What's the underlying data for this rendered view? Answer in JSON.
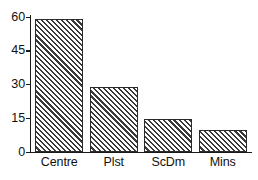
{
  "chart_data": {
    "type": "bar",
    "title": "",
    "subtitle": "",
    "xlabel": "",
    "ylabel": "",
    "categories": [
      "Centre",
      "Plst",
      "ScDm",
      "Mins"
    ],
    "values": [
      59,
      29,
      14.5,
      10
    ],
    "series": [
      {
        "name": "",
        "values": [
          59,
          29,
          14.5,
          10
        ]
      }
    ],
    "ylim": [
      0,
      60
    ],
    "yticks": [
      0,
      15,
      30,
      45,
      60
    ],
    "ytick_labels": [
      "0",
      "15",
      "30",
      "45",
      "60"
    ],
    "grid": false,
    "legend": false,
    "legend_position": "none",
    "annotations": [],
    "bar_style": {
      "fill": "#ffffff",
      "hatch": "/",
      "hatch_color": "#3a3a3a",
      "edge_color": "#2b2b2b"
    },
    "axis_color": "#1a1a1a",
    "background": "#ffffff"
  }
}
